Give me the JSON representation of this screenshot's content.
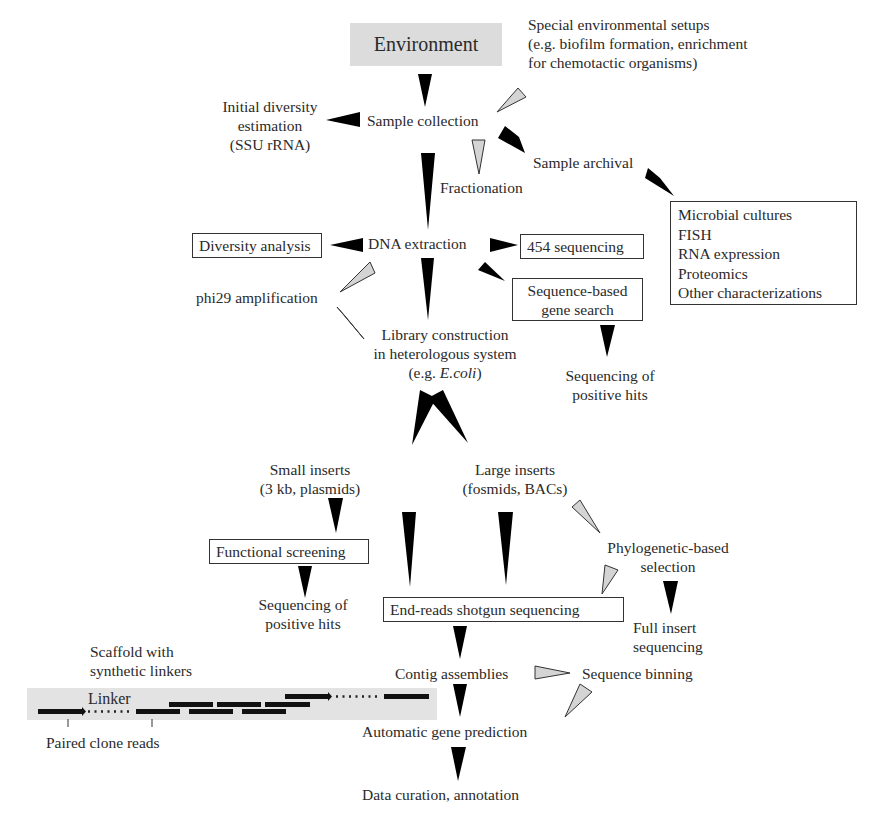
{
  "diagram": {
    "root": "Environment",
    "nodes": {
      "special_setups": [
        "Special environmental setups",
        "(e.g. biofilm formation, enrichment",
        "for chemotactic organisms)"
      ],
      "initial_diversity": [
        "Initial diversity",
        "estimation",
        "(SSU rRNA)"
      ],
      "sample_collection": "Sample collection",
      "fractionation": "Fractionation",
      "sample_archival": "Sample archival",
      "archival_box": [
        "Microbial cultures",
        "FISH",
        "RNA expression",
        "Proteomics",
        "Other characterizations"
      ],
      "diversity_analysis": "Diversity analysis",
      "dna_extraction": "DNA extraction",
      "sequencing_454": "454 sequencing",
      "phi29": "phi29 amplification",
      "seq_gene_search": [
        "Sequence-based",
        "gene search"
      ],
      "library_construction": [
        "Library construction",
        "in heterologous system"
      ],
      "library_example_prefix": "(e.g. ",
      "library_example_italic": "E.coli",
      "library_example_suffix": ")",
      "seq_positive_hits_1": [
        "Sequencing of",
        "positive hits"
      ],
      "small_inserts": [
        "Small inserts",
        "(3 kb, plasmids)"
      ],
      "large_inserts": [
        "Large inserts",
        "(fosmids, BACs)"
      ],
      "functional_screening": "Functional screening",
      "phylogenetic_selection": [
        "Phylogenetic-based",
        "selection"
      ],
      "seq_positive_hits_2": [
        "Sequencing of",
        "positive hits"
      ],
      "end_reads": "End-reads shotgun sequencing",
      "full_insert": [
        "Full insert",
        "sequencing"
      ],
      "contig_assemblies": "Contig assemblies",
      "sequence_binning": "Sequence binning",
      "gene_prediction": "Automatic gene prediction",
      "data_curation": "Data curation, annotation"
    },
    "scaffold_inset": {
      "title": [
        "Scaffold with",
        "synthetic linkers"
      ],
      "linker_label": "Linker",
      "paired_label": "Paired clone reads"
    },
    "colors": {
      "solid_arrow": "#000000",
      "hollow_arrow_fill": "#d4d4d4",
      "environment_bg": "#dcdcdc",
      "scaffold_bg": "#e3e3e3",
      "text": "#2a2a2a"
    }
  }
}
